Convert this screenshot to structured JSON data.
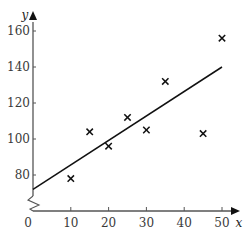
{
  "chart_data": {
    "type": "scatter",
    "title": "",
    "xlabel": "x",
    "ylabel": "y",
    "xlim": [
      0,
      52
    ],
    "ylim": [
      60,
      165
    ],
    "x_ticks": [
      10,
      20,
      30,
      40,
      50
    ],
    "y_ticks": [
      80,
      100,
      120,
      140,
      160
    ],
    "origin_label": "0",
    "y_axis_break": true,
    "grid": false,
    "legend": null,
    "marker": "x",
    "points": [
      {
        "x": 10,
        "y": 78
      },
      {
        "x": 15,
        "y": 104
      },
      {
        "x": 20,
        "y": 96
      },
      {
        "x": 25,
        "y": 112
      },
      {
        "x": 30,
        "y": 105
      },
      {
        "x": 35,
        "y": 132
      },
      {
        "x": 45,
        "y": 103
      },
      {
        "x": 50,
        "y": 156
      }
    ],
    "regression_line": {
      "x0": 0,
      "y0": 72,
      "x1": 50,
      "y1": 140
    }
  }
}
